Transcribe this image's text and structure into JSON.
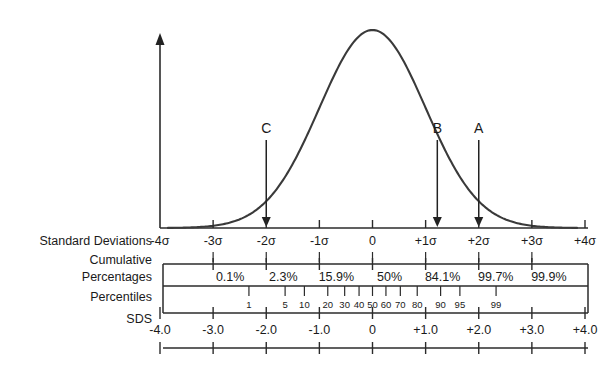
{
  "figure": {
    "background_color": "#ffffff",
    "line_color": "#2b2b2b",
    "curve_color": "#3a3a3a"
  },
  "rows": {
    "standard_deviations_label": "Standard Deviations",
    "cumulative_label_line1": "Cumulative",
    "cumulative_label_line2": "Percentages",
    "percentiles_label": "Percentiles",
    "sds_label": "SDS"
  },
  "pointers": [
    {
      "name": "A",
      "label": "A",
      "sd": 2.0
    },
    {
      "name": "B",
      "label": "B",
      "sd": 1.22
    },
    {
      "name": "C",
      "label": "C",
      "sd": -2.0
    }
  ],
  "chart_data": {
    "type": "line",
    "xlabel": "Standard Deviations",
    "ylabel": "",
    "xlim": [
      -4.4,
      4.4
    ],
    "grid": false,
    "legend": "none",
    "curve": {
      "name": "normal-density",
      "mean": 0,
      "sd": 1,
      "peak_x": 0
    },
    "standard_deviations": {
      "ticks": [
        -4,
        -3,
        -2,
        -1,
        0,
        1,
        2,
        3,
        4
      ],
      "tick_labels": [
        "-4σ",
        "-3σ",
        "-2σ",
        "-1σ",
        "0",
        "+1σ",
        "+2σ",
        "+3σ",
        "+4σ"
      ]
    },
    "cumulative_percentages": {
      "at_sd": [
        -3,
        -2,
        -1,
        0,
        1,
        2,
        3
      ],
      "labels": [
        "0.1%",
        "2.3%",
        "15.9%",
        "50%",
        "84.1%",
        "99.7%",
        "99.9%"
      ],
      "values": [
        0.1,
        2.3,
        15.9,
        50,
        84.1,
        99.7,
        99.9
      ]
    },
    "percentiles": {
      "labels": [
        "1",
        "5",
        "10",
        "20",
        "30",
        "40",
        "50",
        "60",
        "70",
        "80",
        "90",
        "95",
        "99"
      ],
      "values": [
        1,
        5,
        10,
        20,
        30,
        40,
        50,
        60,
        70,
        80,
        90,
        95,
        99
      ],
      "at_sd": [
        -2.326,
        -1.645,
        -1.282,
        -0.842,
        -0.524,
        -0.253,
        0,
        0.253,
        0.524,
        0.842,
        1.282,
        1.645,
        2.326
      ]
    },
    "sds_scale": {
      "ticks": [
        -4,
        -3,
        -2,
        -1,
        0,
        1,
        2,
        3,
        4
      ],
      "tick_labels": [
        "-4.0",
        "-3.0",
        "-2.0",
        "-1.0",
        "0",
        "+1.0",
        "+2.0",
        "+3.0",
        "+4.0"
      ]
    },
    "annotations": [
      {
        "text": "A",
        "sd": 2.0
      },
      {
        "text": "B",
        "sd": 1.22
      },
      {
        "text": "C",
        "sd": -2.0
      }
    ]
  }
}
